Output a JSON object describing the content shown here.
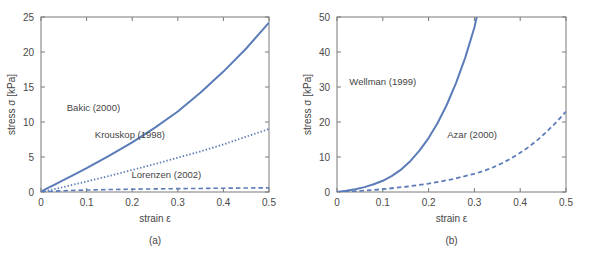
{
  "figure": {
    "background": "#ffffff",
    "accent_color": "#5b7cb8",
    "axis_color": "#7a7a7a",
    "text_color": "#444444"
  },
  "chart_data": [
    {
      "type": "line",
      "panel_id": "a",
      "caption": "(a)",
      "title": "",
      "xlabel": "strain ε",
      "ylabel": "stress σ [kPa]",
      "xlim": [
        0,
        0.5
      ],
      "ylim": [
        0,
        25
      ],
      "xticks": [
        0,
        0.1,
        0.2,
        0.3,
        0.4,
        0.5
      ],
      "xticklabels": [
        "0",
        "0.1",
        "0.2",
        "0.3",
        "0.4",
        "0.5"
      ],
      "yticks": [
        0,
        5,
        10,
        15,
        20,
        25
      ],
      "yticklabels": [
        "0",
        "5",
        "10",
        "15",
        "20",
        "25"
      ],
      "grid": false,
      "legend_position": "inline-annotations",
      "series": [
        {
          "name": "Bakic (2000)",
          "style": "solid",
          "color": "#5b7cb8",
          "width": 2.0,
          "label_x": 0.115,
          "label_y": 11.6,
          "x": [
            0,
            0.005,
            0.01,
            0.02,
            0.03,
            0.05,
            0.075,
            0.1,
            0.15,
            0.2,
            0.25,
            0.3,
            0.35,
            0.4,
            0.45,
            0.5
          ],
          "y": [
            0,
            0.22,
            0.4,
            0.72,
            1.05,
            1.72,
            2.55,
            3.4,
            5.2,
            7.1,
            9.2,
            11.5,
            14.2,
            17.2,
            20.5,
            24.2
          ]
        },
        {
          "name": "Krouskop (1998)",
          "style": "dotted",
          "color": "#5b7cb8",
          "width": 1.8,
          "label_x": 0.195,
          "label_y": 7.7,
          "x": [
            0,
            0.02,
            0.05,
            0.1,
            0.15,
            0.2,
            0.25,
            0.3,
            0.35,
            0.4,
            0.45,
            0.5
          ],
          "y": [
            0,
            0.28,
            0.72,
            1.5,
            2.3,
            3.15,
            4.0,
            4.9,
            5.8,
            6.8,
            7.9,
            9.0
          ]
        },
        {
          "name": "Lorenzen (2002)",
          "style": "dashed",
          "color": "#5b7cb8",
          "width": 1.6,
          "label_x": 0.275,
          "label_y": 2.05,
          "x": [
            0,
            0.01,
            0.03,
            0.05,
            0.1,
            0.15,
            0.2,
            0.25,
            0.3,
            0.35,
            0.4,
            0.45,
            0.5
          ],
          "y": [
            0,
            0.05,
            0.12,
            0.18,
            0.28,
            0.35,
            0.4,
            0.44,
            0.48,
            0.51,
            0.54,
            0.57,
            0.6
          ]
        }
      ]
    },
    {
      "type": "line",
      "panel_id": "b",
      "caption": "(b)",
      "title": "",
      "xlabel": "strain ε",
      "ylabel": "stress σ [kPa]",
      "xlim": [
        0,
        0.5
      ],
      "ylim": [
        0,
        50
      ],
      "xticks": [
        0,
        0.1,
        0.2,
        0.3,
        0.4,
        0.5
      ],
      "xticklabels": [
        "0",
        "0.1",
        "0.2",
        "0.3",
        "0.4",
        "0.5"
      ],
      "yticks": [
        0,
        10,
        20,
        30,
        40,
        50
      ],
      "yticklabels": [
        "0",
        "10",
        "20",
        "30",
        "40",
        "50"
      ],
      "grid": false,
      "legend_position": "inline-annotations",
      "series": [
        {
          "name": "Wellman (1999)",
          "style": "solid",
          "color": "#5b7cb8",
          "width": 2.0,
          "label_x": 0.1,
          "label_y": 30.5,
          "x": [
            0,
            0.02,
            0.04,
            0.06,
            0.08,
            0.1,
            0.12,
            0.14,
            0.16,
            0.18,
            0.2,
            0.22,
            0.24,
            0.26,
            0.28,
            0.3,
            0.305
          ],
          "y": [
            0,
            0.35,
            0.8,
            1.4,
            2.2,
            3.2,
            4.6,
            6.4,
            8.8,
            11.8,
            15.4,
            19.8,
            25.0,
            31.2,
            38.4,
            47.0,
            50.0
          ]
        },
        {
          "name": "Azar (2000)",
          "style": "dashed",
          "color": "#5b7cb8",
          "width": 1.8,
          "label_x": 0.295,
          "label_y": 15.5,
          "x": [
            0,
            0.05,
            0.1,
            0.15,
            0.2,
            0.25,
            0.3,
            0.32,
            0.34,
            0.36,
            0.38,
            0.4,
            0.42,
            0.44,
            0.46,
            0.48,
            0.5
          ],
          "y": [
            0,
            0.3,
            0.8,
            1.5,
            2.4,
            3.6,
            5.2,
            6.0,
            7.0,
            8.2,
            9.6,
            11.2,
            13.0,
            15.1,
            17.5,
            20.1,
            23.0
          ]
        }
      ]
    }
  ]
}
